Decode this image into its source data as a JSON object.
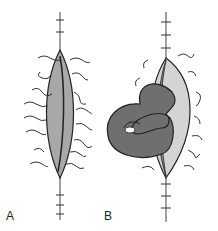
{
  "figure": {
    "panels": [
      {
        "id": "A",
        "label": "A",
        "description": "closed elliptical incision with retention sutures"
      },
      {
        "id": "B",
        "label": "B",
        "description": "wound dehiscence with eviscerated bowel loop"
      }
    ]
  },
  "colors": {
    "line": "#2a2a2a",
    "wound_fill": "#9a9a9a",
    "wound_light": "#cfcfcf",
    "bowel": "#6f6f6f",
    "bowel_dark": "#4a4a4a"
  }
}
